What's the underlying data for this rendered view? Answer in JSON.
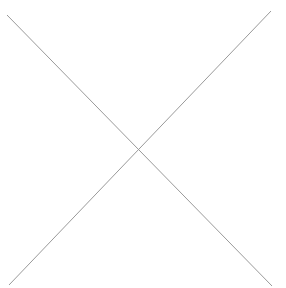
{
  "placeholder": {
    "kind": "image-placeholder-cross",
    "icon": "x-cross-icon",
    "stroke_color": "#9a9a9a",
    "background_color": "#ffffff",
    "lines": [
      {
        "x1": 7,
        "y1": 15,
        "x2": 272,
        "y2": 286
      },
      {
        "x1": 271,
        "y1": 11,
        "x2": 9,
        "y2": 285
      }
    ]
  }
}
